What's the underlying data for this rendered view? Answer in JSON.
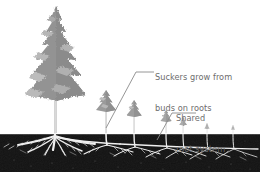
{
  "figure": {
    "name": "tree-sucker-propagation-diagram",
    "width": 260,
    "height": 172,
    "background_color": "#ffffff"
  },
  "labels": {
    "suckers": {
      "line1": "Suckers grow from",
      "line2": "buds on roots",
      "color": "#6d6d6d",
      "x": 155,
      "y": 52
    },
    "shared": {
      "line1": "Shared",
      "line2": "root system",
      "color": "#6d6d6d",
      "x": 176,
      "y": 93
    }
  },
  "leader_lines": {
    "suckers_leader": {
      "name": "leader-line-suckers",
      "color": "#8a8a8a",
      "points": "106,128 136,72 154,72"
    },
    "shared_leader": {
      "name": "leader-line-shared",
      "color": "#8a8a8a",
      "points": "157,140 172,113 196,113"
    }
  },
  "soil": {
    "name": "soil-band",
    "color": "#121212",
    "top_y": 133,
    "bottom_y": 172,
    "speckle_color": "#4a4a4a"
  },
  "ground_line": {
    "color": "#ffffff",
    "y": 133
  },
  "main_tree": {
    "name": "main-conifer-tree",
    "canopy_color": "#939393",
    "canopy_highlight": "#b4b4b4",
    "canopy_shadow": "#7c7c7c",
    "trunk_color": "#c9c9c9",
    "center_x": 56,
    "canopy_top_y": 6,
    "canopy_bottom_y": 101,
    "trunk_bottom_y": 133
  },
  "suckers": [
    {
      "name": "sucker-1",
      "center_x": 106,
      "canopy_bottom_y": 110,
      "size": 11,
      "canopy_color": "#9a9a9a",
      "trunk_color": "#cfcfcf"
    },
    {
      "name": "sucker-2",
      "center_x": 134,
      "canopy_bottom_y": 116,
      "size": 8.5,
      "canopy_color": "#9d9d9d",
      "trunk_color": "#d2d2d2"
    },
    {
      "name": "sucker-3",
      "center_x": 166,
      "canopy_bottom_y": 122,
      "size": 6,
      "canopy_color": "#a5a5a5",
      "trunk_color": "#d6d6d6"
    },
    {
      "name": "sucker-4",
      "center_x": 183,
      "canopy_bottom_y": 126,
      "size": 4.2,
      "canopy_color": "#ababab",
      "trunk_color": "#d9d9d9"
    },
    {
      "name": "sucker-5",
      "center_x": 207,
      "canopy_bottom_y": 129,
      "size": 2.6,
      "canopy_color": "#b0b0b0",
      "trunk_color": "#dcdcdc"
    },
    {
      "name": "sucker-6",
      "center_x": 233,
      "canopy_bottom_y": 130,
      "size": 2.2,
      "canopy_color": "#b3b3b3",
      "trunk_color": "#dedede"
    }
  ],
  "root_system": {
    "name": "shared-root-system",
    "color": "#f2f2f2",
    "secondary_color": "#cccccc",
    "main_depth_y": 146,
    "description": "horizontal lateral roots linking main tree to all suckers"
  }
}
